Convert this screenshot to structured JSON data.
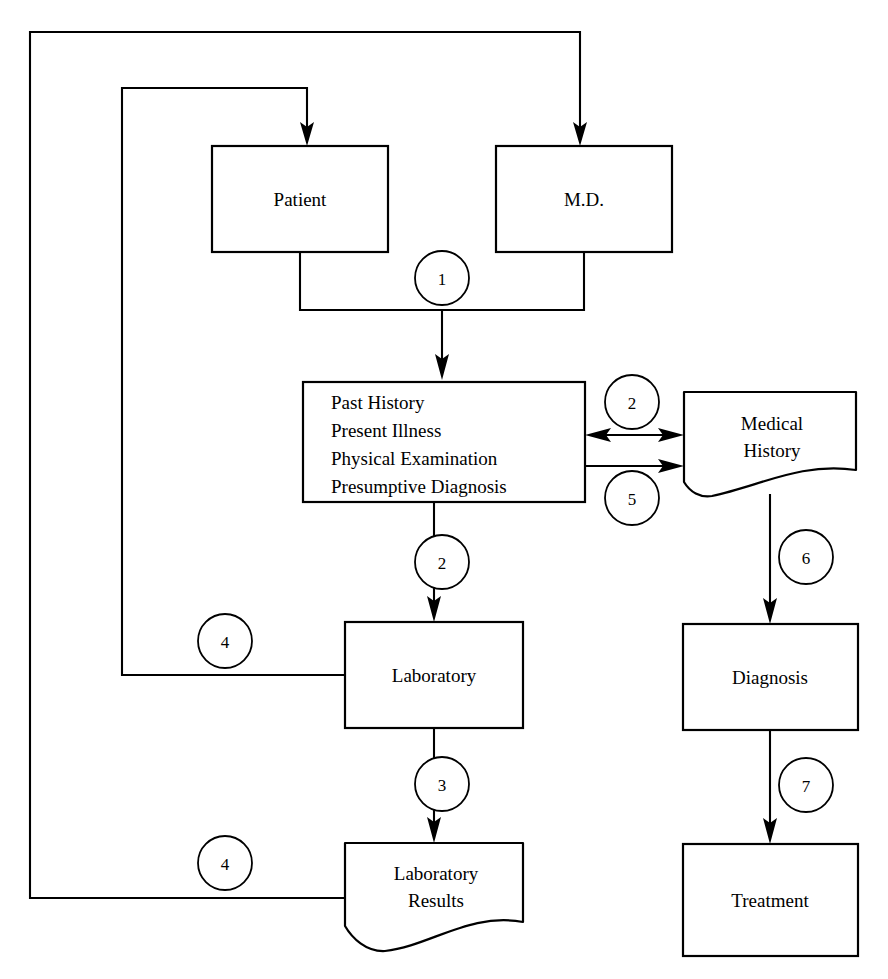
{
  "diagram": {
    "background_color": "#ffffff",
    "line_color": "#000000",
    "nodes": {
      "patient": {
        "label": "Patient",
        "shape": "rectangle"
      },
      "md": {
        "label": "M.D.",
        "shape": "rectangle"
      },
      "clinical_record": {
        "shape": "rectangle",
        "lines": [
          "Past History",
          "Present Illness",
          "Physical Examination",
          "Presumptive Diagnosis"
        ]
      },
      "medical_history": {
        "shape": "document",
        "lines": [
          "Medical",
          "History"
        ]
      },
      "laboratory": {
        "label": "Laboratory",
        "shape": "rectangle"
      },
      "diagnosis": {
        "label": "Diagnosis",
        "shape": "rectangle"
      },
      "laboratory_results": {
        "shape": "document",
        "lines": [
          "Laboratory",
          "Results"
        ]
      },
      "treatment": {
        "label": "Treatment",
        "shape": "rectangle"
      }
    },
    "step_markers": [
      {
        "id": "m1",
        "number": "1"
      },
      {
        "id": "m2-history",
        "number": "2"
      },
      {
        "id": "m2-lab",
        "number": "2"
      },
      {
        "id": "m5",
        "number": "5"
      },
      {
        "id": "m6",
        "number": "6"
      },
      {
        "id": "m3",
        "number": "3"
      },
      {
        "id": "m7",
        "number": "7"
      },
      {
        "id": "m4-lab",
        "number": "4"
      },
      {
        "id": "m4-results",
        "number": "4"
      }
    ]
  }
}
